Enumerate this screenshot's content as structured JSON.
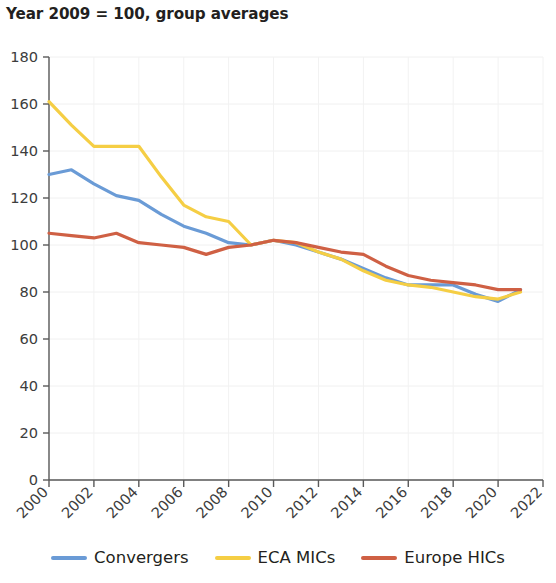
{
  "chart_data": {
    "type": "line",
    "title": "Year 2009 = 100, group averages",
    "subtitle": "",
    "xlabel": "",
    "ylabel": "",
    "xlim": [
      2000,
      2022
    ],
    "ylim": [
      0,
      180
    ],
    "ytick_step": 20,
    "xtick_step": 2,
    "grid": true,
    "legend_position": "bottom",
    "yticks": [
      "0",
      "20",
      "40",
      "60",
      "80",
      "100",
      "120",
      "140",
      "160",
      "180"
    ],
    "xticks": [
      "2000",
      "2002",
      "2004",
      "2006",
      "2008",
      "2010",
      "2012",
      "2014",
      "2016",
      "2018",
      "2020",
      "2022"
    ],
    "x": [
      2000,
      2001,
      2002,
      2003,
      2004,
      2005,
      2006,
      2007,
      2008,
      2009,
      2010,
      2011,
      2012,
      2013,
      2014,
      2015,
      2016,
      2017,
      2018,
      2019,
      2020,
      2021
    ],
    "series": [
      {
        "name": "Convergers",
        "color": "#6a9bd6",
        "values": [
          130,
          132,
          126,
          121,
          119,
          113,
          108,
          105,
          101,
          100,
          102,
          100,
          97,
          94,
          90,
          86,
          83,
          83,
          83,
          79,
          76,
          81
        ]
      },
      {
        "name": "ECA MICs",
        "color": "#f5ce44",
        "values": [
          161,
          151,
          142,
          142,
          142,
          129,
          117,
          112,
          110,
          100,
          102,
          101,
          97,
          94,
          89,
          85,
          83,
          82,
          80,
          78,
          77,
          80
        ]
      },
      {
        "name": "Europe HICs",
        "color": "#cf6044",
        "values": [
          105,
          104,
          103,
          105,
          101,
          100,
          99,
          96,
          99,
          100,
          102,
          101,
          99,
          97,
          96,
          91,
          87,
          85,
          84,
          83,
          81,
          81
        ]
      }
    ]
  },
  "legend": {
    "items": [
      {
        "label": "Convergers",
        "color": "#6a9bd6"
      },
      {
        "label": "ECA MICs",
        "color": "#f5ce44"
      },
      {
        "label": "Europe HICs",
        "color": "#cf6044"
      }
    ]
  }
}
